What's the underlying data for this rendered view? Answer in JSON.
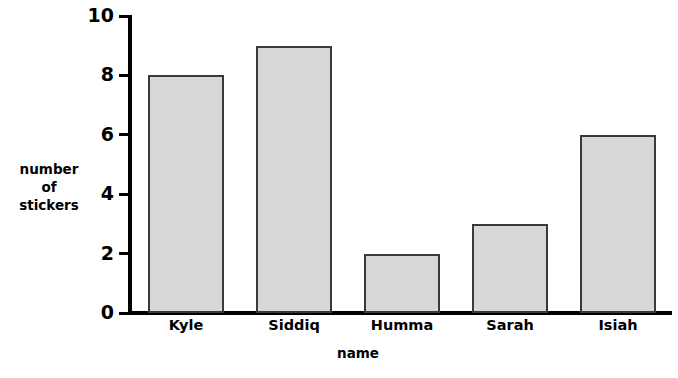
{
  "chart_data": {
    "type": "bar",
    "title": "",
    "subtitle": "",
    "xlabel": "name",
    "ylabel": "number of stickers",
    "ylabel_lines": [
      "number",
      "of",
      "stickers"
    ],
    "categories": [
      "Kyle",
      "Siddiq",
      "Humma",
      "Sarah",
      "Isiah"
    ],
    "values": [
      8,
      9,
      2,
      3,
      6
    ],
    "ylim": [
      0,
      10
    ],
    "yticks": [
      0,
      2,
      4,
      6,
      8,
      10
    ],
    "ytick_labels": [
      "0",
      "2",
      "4",
      "6",
      "8",
      "10"
    ],
    "grid": false,
    "legend": null,
    "legend_position": "none",
    "bar_fill_color": "#d7d7d7",
    "bar_border_color": "#3a3a3a",
    "axis_color": "#000000",
    "background_color": "#ffffff"
  }
}
